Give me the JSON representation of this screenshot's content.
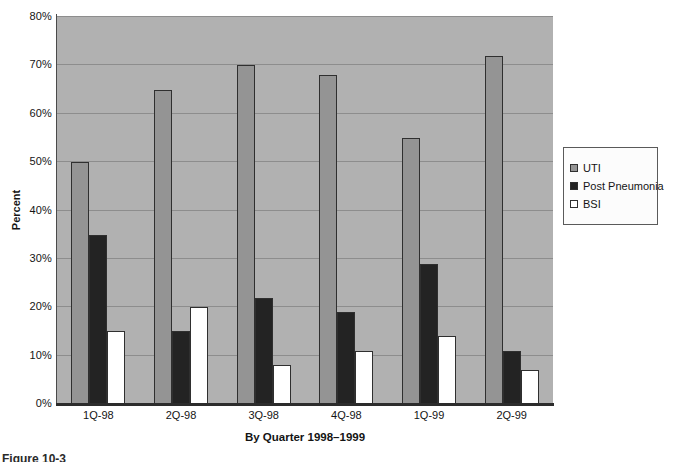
{
  "figure": {
    "caption_fragment": "Figure 10-3"
  },
  "chart_data": {
    "type": "bar",
    "title": "",
    "xlabel": "By Quarter 1998–1999",
    "ylabel": "Percent",
    "categories": [
      "1Q-98",
      "2Q-98",
      "3Q-98",
      "4Q-98",
      "1Q-99",
      "2Q-99"
    ],
    "series": [
      {
        "name": "UTI",
        "color": "#949494",
        "values": [
          50,
          65,
          70,
          68,
          55,
          72
        ]
      },
      {
        "name": "Post Pneumonia",
        "color": "#232323",
        "values": [
          35,
          15,
          22,
          19,
          29,
          11
        ]
      },
      {
        "name": "BSI",
        "color": "#ffffff",
        "values": [
          15,
          20,
          8,
          11,
          14,
          7
        ]
      }
    ],
    "ylim": [
      0,
      80
    ],
    "ytick_step": 10,
    "ytick_labels": [
      "0%",
      "10%",
      "20%",
      "30%",
      "40%",
      "50%",
      "60%",
      "70%",
      "80%"
    ],
    "grid": true,
    "legend_position": "right",
    "colors": {
      "plot_background": "#b1b1b1",
      "gridline": "#8d8d8d",
      "axis_line": "#2c2c2c",
      "page_background": "#ffffff"
    }
  }
}
